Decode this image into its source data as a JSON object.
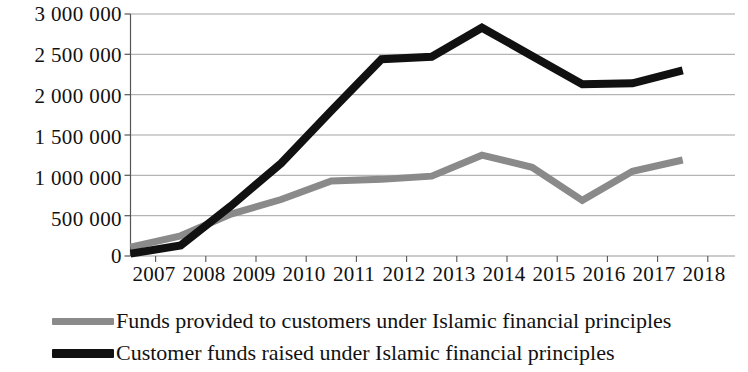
{
  "chart_data": {
    "type": "line",
    "title": "",
    "subtitle": "",
    "xlabel": "",
    "ylabel": "",
    "categories": [
      "2007",
      "2008",
      "2009",
      "2010",
      "2011",
      "2012",
      "2013",
      "2014",
      "2015",
      "2016",
      "2017",
      "2018"
    ],
    "x": [
      2007,
      2008,
      2009,
      2010,
      2011,
      2012,
      2013,
      2014,
      2015,
      2016,
      2017,
      2018
    ],
    "series": [
      {
        "name": "Funds provided to customers under Islamic financial principles",
        "color": "#8a8a8a",
        "values": [
          110000,
          250000,
          520000,
          700000,
          930000,
          950000,
          990000,
          1250000,
          1100000,
          690000,
          1050000,
          1190000
        ]
      },
      {
        "name": "Customer funds raised under Islamic financial principles",
        "color": "#111111",
        "values": [
          30000,
          130000,
          620000,
          1150000,
          1800000,
          2440000,
          2470000,
          2830000,
          2480000,
          2130000,
          2140000,
          2300000
        ]
      }
    ],
    "ylim": [
      0,
      3000000
    ],
    "yticks": [
      0,
      500000,
      1000000,
      1500000,
      2000000,
      2500000,
      3000000
    ],
    "ytick_labels": [
      "0",
      "500 000",
      "1 000 000",
      "1 500 000",
      "2 000 000",
      "2 500 000",
      "3 000 000"
    ],
    "grid": true,
    "grid_axis": "y",
    "legend_position": "bottom-left",
    "axis_color": "#555555",
    "grid_color": "#999999",
    "background": "#ffffff"
  },
  "axes": {
    "y_tick_labels": [
      "3 000 000",
      "2 500 000",
      "2 000 000",
      "1 500 000",
      "1 000 000",
      "500 000",
      "0"
    ],
    "x_tick_labels": [
      "2007",
      "2008",
      "2009",
      "2010",
      "2011",
      "2012",
      "2013",
      "2014",
      "2015",
      "2016",
      "2017",
      "2018"
    ]
  },
  "legend": {
    "entries": [
      {
        "label": "Funds provided to customers under Islamic financial principles",
        "color": "#8a8a8a"
      },
      {
        "label": "Customer funds raised under Islamic financial principles",
        "color": "#111111"
      }
    ]
  }
}
